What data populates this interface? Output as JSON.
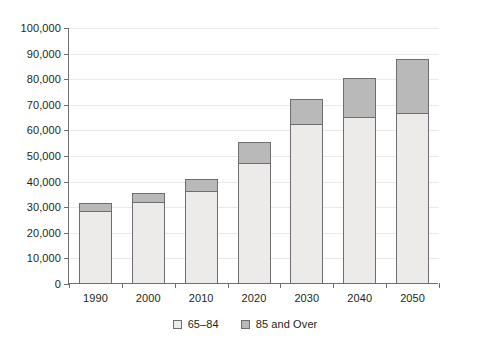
{
  "chart_data": {
    "type": "bar",
    "stacked": true,
    "title": "",
    "xlabel": "",
    "ylabel": "",
    "categories": [
      "1990",
      "2000",
      "2010",
      "2020",
      "2030",
      "2040",
      "2050"
    ],
    "series": [
      {
        "name": "65–84",
        "color": "#edebe9",
        "values": [
          28000,
          31500,
          36000,
          47000,
          62000,
          65000,
          66500
        ]
      },
      {
        "name": "85 and Over",
        "color": "#b9b9b9",
        "values": [
          3200,
          3500,
          4500,
          8000,
          10000,
          15000,
          21000
        ]
      }
    ],
    "totals": [
      31200,
      35000,
      40500,
      55000,
      72000,
      80000,
      87500
    ],
    "ylim": [
      0,
      100000
    ],
    "ytick_values": [
      0,
      10000,
      20000,
      30000,
      40000,
      50000,
      60000,
      70000,
      80000,
      90000,
      100000
    ],
    "ytick_labels": [
      "0",
      "10,000",
      "20,000",
      "30,000",
      "40,000",
      "50,000",
      "60,000",
      "70,000",
      "80,000",
      "90,000",
      "100,000"
    ],
    "grid": true,
    "legend_position": "bottom",
    "legend": [
      {
        "label": "65–84",
        "swatch": "young"
      },
      {
        "label": "85 and Over",
        "swatch": "old"
      }
    ]
  }
}
